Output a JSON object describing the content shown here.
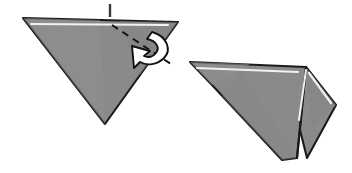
{
  "figure": {
    "background_color": "#ffffff",
    "paper_fill": "#8a8a8a",
    "paper_fill_light": "#929292",
    "paper_fill_shade": "#7f7f7f",
    "outline_color": "#1a1a1a",
    "highlight_color": "#f2f2f2",
    "crease_color": "#111111",
    "arrow_fill": "#ffffff",
    "arrow_stroke": "#111111"
  },
  "panels": [
    {
      "id": "before",
      "name": "left-triangle-before-fold",
      "label": "",
      "shape_points": "23,18 178,22 105,124",
      "highlight_points": "31,24 168,25",
      "crease": {
        "name": "valley-fold-crease",
        "points": "112,25 174,66",
        "style": "dashed"
      },
      "tick": {
        "name": "reference-tick-mark",
        "points": "110,4 110,17"
      },
      "arrow": {
        "name": "fold-direction-arrow",
        "rotation": "counter-clockwise",
        "body_path": "M 160,36 C 168,44 166,56 156,61 C 148,65 139,63 133,58",
        "head_points": "137,49 137,67 120,60"
      }
    },
    {
      "id": "after",
      "name": "right-folded-result",
      "label": "",
      "main_points": "190,62 306,67 297,158 282,160 212,85",
      "main_highlight": "197,68 298,72",
      "flap_points": "306,67 336,105 307,158 297,118",
      "flap_highlight": "309,73 331,103",
      "fold_edge": "306,67 297,158",
      "inner_crease": "306,70 299,120"
    }
  ]
}
